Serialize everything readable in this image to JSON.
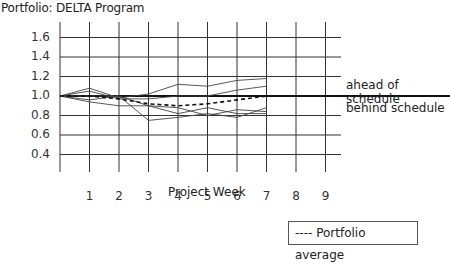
{
  "title": "Portfolio: DELTA Program",
  "annotations": {
    "ahead": "ahead of schedule",
    "behind": "behind schedule"
  },
  "legend": {
    "average_label": "---- Portfolio average"
  },
  "chart_data": {
    "type": "line",
    "title": "Portfolio: DELTA Program",
    "xlabel": "Project Week",
    "ylabel": "",
    "x": [
      0,
      1,
      2,
      3,
      4,
      5,
      6,
      7
    ],
    "x_ticks": [
      "1",
      "2",
      "3",
      "4",
      "5",
      "6",
      "7",
      "8",
      "9"
    ],
    "y_ticks": [
      "1.6",
      "1.4",
      "1.2",
      "1.0",
      "0.8",
      "0.6",
      "0.4"
    ],
    "xlim": [
      0,
      9.5
    ],
    "ylim": [
      0.2,
      1.7
    ],
    "grid": true,
    "reference_line": {
      "y": 1.0,
      "above_label": "ahead of schedule",
      "below_label": "behind schedule"
    },
    "legend_position": "bottom-right",
    "series": [
      {
        "name": "Project A",
        "style": "solid",
        "values": [
          1.0,
          1.08,
          0.98,
          1.02,
          1.12,
          1.1,
          1.16,
          1.18
        ]
      },
      {
        "name": "Project B",
        "style": "solid",
        "values": [
          1.0,
          1.05,
          0.97,
          0.97,
          1.0,
          1.0,
          1.06,
          1.1
        ]
      },
      {
        "name": "Project C",
        "style": "solid",
        "values": [
          1.0,
          1.0,
          1.0,
          0.9,
          0.88,
          0.8,
          0.86,
          0.84
        ]
      },
      {
        "name": "Project D",
        "style": "solid",
        "values": [
          1.0,
          0.96,
          1.0,
          0.75,
          0.78,
          0.82,
          0.78,
          0.88
        ]
      },
      {
        "name": "Project E",
        "style": "solid",
        "values": [
          1.0,
          0.94,
          0.9,
          0.9,
          0.82,
          0.88,
          0.82,
          0.82
        ]
      },
      {
        "name": "Portfolio average",
        "style": "dashed",
        "values": [
          1.0,
          1.0,
          0.97,
          0.92,
          0.9,
          0.92,
          0.96,
          1.0
        ]
      }
    ]
  }
}
